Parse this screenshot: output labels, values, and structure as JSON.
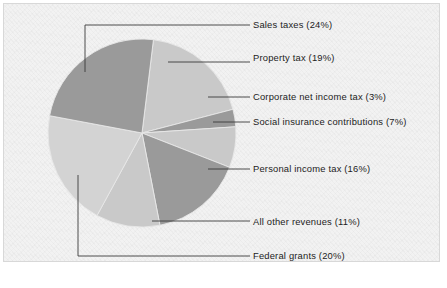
{
  "figure": {
    "background_color": "#ffffff",
    "plate_color": "#f2f2f2",
    "border_color": "#d8d8d8",
    "leader_color": "#3a3a3a",
    "text_color": "#1c1c1c"
  },
  "chart_data": {
    "type": "pie",
    "title": "",
    "subtitle": "",
    "xlabel": "",
    "ylabel": "",
    "legend_position": "callout-labels-right",
    "grid": false,
    "units": "percent",
    "start_angle_deg": -83,
    "direction": "clockwise",
    "center": {
      "x": 142,
      "y": 133
    },
    "radius": 94,
    "total": 100,
    "categories": [
      "Property tax",
      "Corporate net income tax",
      "Social insurance contributions",
      "Personal income tax",
      "All other revenues",
      "Federal grants",
      "Sales taxes"
    ],
    "values": [
      19,
      3,
      7,
      16,
      11,
      20,
      24
    ],
    "slices": [
      {
        "label": "Property tax (19%)",
        "name": "Property tax",
        "value": 19,
        "color": "#c9c9c9",
        "label_x": 253,
        "label_y": 52,
        "leader": "M 168 62 L 222 62 L 250 62"
      },
      {
        "label": "Corporate net income tax (3%)",
        "name": "Corporate net income tax",
        "value": 3,
        "color": "#9a9a9a",
        "label_x": 253,
        "label_y": 91,
        "leader": "M 208 97 L 250 97"
      },
      {
        "label": "Social insurance contributions (7%)",
        "name": "Social insurance contributions",
        "value": 7,
        "color": "#c9c9c9",
        "label_x": 253,
        "label_y": 116,
        "leader": "M 213 122 L 250 122"
      },
      {
        "label": "Personal income tax (16%)",
        "name": "Personal income tax",
        "value": 16,
        "color": "#9a9a9a",
        "label_x": 253,
        "label_y": 163,
        "leader": "M 208 169 L 250 169"
      },
      {
        "label": "All other revenues (11%)",
        "name": "All other revenues",
        "value": 11,
        "color": "#c9c9c9",
        "label_x": 253,
        "label_y": 216,
        "leader": "M 152 221 L 250 221"
      },
      {
        "label": "Federal grants (20%)",
        "name": "Federal grants",
        "value": 20,
        "color": "#d3d3d3",
        "label_x": 253,
        "label_y": 250,
        "leader": "M 78 175 L 78 256 L 250 256"
      },
      {
        "label": "Sales taxes (24%)",
        "name": "Sales taxes",
        "value": 24,
        "color": "#9a9a9a",
        "label_x": 253,
        "label_y": 19,
        "leader": "M 85 72 L 85 25 L 250 25"
      }
    ]
  }
}
